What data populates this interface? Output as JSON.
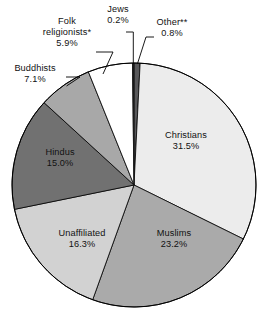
{
  "chart_data": {
    "type": "pie",
    "title": "",
    "subtitle": "",
    "xlabel": "",
    "ylabel": "",
    "legend_position": "none",
    "grid": false,
    "unit": "%",
    "slices": [
      {
        "label": "Other**",
        "value": 0.8,
        "value_label": "0.8%",
        "color": "#58585a",
        "placement": "outside",
        "leader_line": true
      },
      {
        "label": "Christians",
        "value": 31.5,
        "value_label": "31.5%",
        "color": "#ececec",
        "placement": "inside",
        "leader_line": false
      },
      {
        "label": "Muslims",
        "value": 23.2,
        "value_label": "23.2%",
        "color": "#aaaaaa",
        "placement": "inside",
        "leader_line": false
      },
      {
        "label": "Unaffiliated",
        "value": 16.3,
        "value_label": "16.3%",
        "color": "#d2d2d2",
        "placement": "inside",
        "leader_line": false
      },
      {
        "label": "Hindus",
        "value": 15.0,
        "value_label": "15.0%",
        "color": "#717171",
        "placement": "inside",
        "leader_line": false
      },
      {
        "label": "Buddhists",
        "value": 7.1,
        "value_label": "7.1%",
        "color": "#a8a8a8",
        "placement": "outside",
        "leader_line": true
      },
      {
        "label": "Folk religionists*",
        "value": 5.9,
        "value_label": "5.9%",
        "color": "#ffffff",
        "placement": "outside",
        "leader_line": true
      },
      {
        "label": "Jews",
        "value": 0.2,
        "value_label": "0.2%",
        "color": "#1a1a1a",
        "placement": "outside",
        "leader_line": true
      }
    ]
  },
  "labels": {
    "jews": {
      "name": "Jews",
      "value": "0.2%"
    },
    "other": {
      "name": "Other**",
      "value": "0.8%"
    },
    "folk_line1": "Folk",
    "folk_line2": "religionists*",
    "folk_value": "5.9%",
    "buddhists": {
      "name": "Buddhists",
      "value": "7.1%"
    },
    "hindus": {
      "name": "Hindus",
      "value": "15.0%"
    },
    "unaffiliated": {
      "name": "Unaffiliated",
      "value": "16.3%"
    },
    "muslims": {
      "name": "Muslims",
      "value": "23.2%"
    },
    "christians": {
      "name": "Christians",
      "value": "31.5%"
    }
  }
}
